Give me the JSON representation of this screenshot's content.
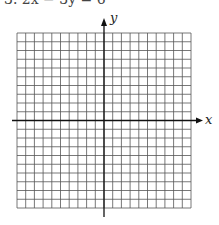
{
  "problem": {
    "label": "3. 2x − 3y = 6"
  },
  "axes": {
    "x_label": "x",
    "y_label": "y"
  },
  "grid": {
    "cols": 20,
    "rows": 20,
    "left": 17,
    "top": 33,
    "right": 191,
    "bottom": 208,
    "line_color": "#555555",
    "axis_color": "#111111"
  }
}
